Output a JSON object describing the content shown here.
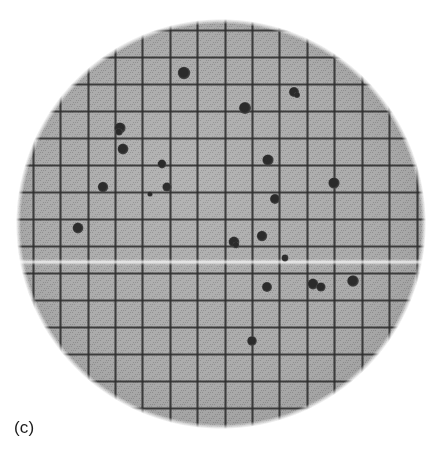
{
  "figure": {
    "panel_label": "(c)",
    "caption_position": "bottom-left",
    "background_color": "#ffffff",
    "width": 438,
    "height": 463
  },
  "plate": {
    "name": "petri-dish-plate",
    "shape": "circle",
    "center_x": 221,
    "center_y": 224,
    "radius": 204,
    "fill_color": "#ababab",
    "halftone_dot_color": "#8f8f8f",
    "edge_softness_px": 4,
    "glare_line": {
      "y": 262,
      "color": "#d8d8d8",
      "thickness": 2
    }
  },
  "grid": {
    "name": "counting-grid",
    "line_color": "#2e2e2e",
    "line_width": 2.1,
    "spacing_x": 27.4,
    "spacing_y": 27.2,
    "origin_x": 33,
    "origin_y": 30,
    "vertical_line_count": 15,
    "horizontal_line_count": 15,
    "vertical_lines": [
      33,
      60,
      88,
      115,
      142,
      170,
      197,
      225,
      252,
      279,
      307,
      334,
      362,
      389,
      417
    ],
    "horizontal_lines": [
      30,
      57,
      84,
      111,
      138,
      165,
      192,
      219,
      246,
      273,
      300,
      327,
      354,
      381,
      408
    ]
  },
  "colonies": {
    "name": "bacterial-colonies",
    "count": 24,
    "color": "#2b2b2b",
    "rim_color": "#4a4a4a",
    "items": [
      {
        "x": 184,
        "y": 73,
        "r": 6.2
      },
      {
        "x": 294,
        "y": 92,
        "r": 5.0
      },
      {
        "x": 245,
        "y": 108,
        "r": 6.0
      },
      {
        "x": 120,
        "y": 128,
        "r": 5.6
      },
      {
        "x": 123,
        "y": 149,
        "r": 5.4
      },
      {
        "x": 162,
        "y": 164,
        "r": 4.4
      },
      {
        "x": 268,
        "y": 160,
        "r": 5.6
      },
      {
        "x": 103,
        "y": 187,
        "r": 5.2
      },
      {
        "x": 167,
        "y": 187,
        "r": 4.6
      },
      {
        "x": 150,
        "y": 194,
        "r": 2.6
      },
      {
        "x": 334,
        "y": 183,
        "r": 5.6
      },
      {
        "x": 275,
        "y": 199,
        "r": 5.0
      },
      {
        "x": 78,
        "y": 228,
        "r": 5.4
      },
      {
        "x": 262,
        "y": 236,
        "r": 5.2
      },
      {
        "x": 234,
        "y": 242,
        "r": 5.4
      },
      {
        "x": 285,
        "y": 258,
        "r": 3.4
      },
      {
        "x": 267,
        "y": 287,
        "r": 5.0
      },
      {
        "x": 313,
        "y": 284,
        "r": 5.4
      },
      {
        "x": 321,
        "y": 287,
        "r": 4.6
      },
      {
        "x": 353,
        "y": 281,
        "r": 5.8
      },
      {
        "x": 252,
        "y": 341,
        "r": 4.8
      },
      {
        "x": 297,
        "y": 95,
        "r": 3.0
      },
      {
        "x": 119,
        "y": 132,
        "r": 3.6
      },
      {
        "x": 236,
        "y": 245,
        "r": 3.2
      }
    ]
  },
  "chart_data": {
    "type": "scatter",
    "title": "(c)",
    "xlabel": "",
    "ylabel": "",
    "xlim": [
      0,
      15
    ],
    "ylim": [
      0,
      15
    ],
    "grid": true,
    "legend": "none",
    "series": [
      {
        "name": "colonies",
        "marker": "filled-circle",
        "color": "#2b2b2b",
        "x": [
          5.5,
          9.5,
          7.7,
          3.2,
          3.3,
          4.7,
          8.6,
          2.6,
          4.9,
          4.3,
          11.0,
          8.8,
          1.6,
          8.4,
          7.3,
          9.2,
          8.5,
          10.2,
          10.5,
          11.7,
          8.0
        ],
        "y": [
          1.6,
          2.3,
          2.9,
          3.6,
          4.4,
          4.9,
          4.8,
          5.8,
          5.8,
          6.0,
          5.6,
          6.2,
          7.3,
          7.6,
          7.8,
          8.6,
          9.4,
          9.3,
          9.4,
          9.2,
          11.4
        ]
      }
    ]
  }
}
